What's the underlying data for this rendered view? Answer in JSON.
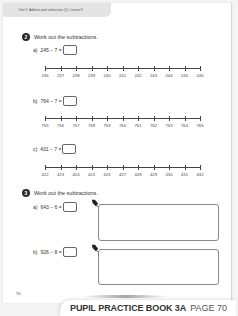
{
  "header": {
    "unit_text": "Unit 2: Addition and subtraction (2), Lesson 8"
  },
  "question2": {
    "number": "2",
    "title": "Work out the subtractions.",
    "parts": [
      {
        "label": "a)",
        "expression": "245 − 7 =",
        "number_line": [
          "236",
          "237",
          "238",
          "239",
          "240",
          "241",
          "242",
          "243",
          "244",
          "245",
          "246"
        ]
      },
      {
        "label": "b)",
        "expression": "764 − 7 =",
        "number_line": [
          "755",
          "756",
          "757",
          "758",
          "759",
          "760",
          "761",
          "762",
          "763",
          "764",
          "765"
        ]
      },
      {
        "label": "c)",
        "expression": "431 − 7 =",
        "number_line": [
          "422",
          "423",
          "424",
          "425",
          "426",
          "427",
          "428",
          "429",
          "430",
          "431",
          "432"
        ]
      }
    ]
  },
  "question3": {
    "number": "3",
    "title": "Work out the subtractions.",
    "parts": [
      {
        "label": "a)",
        "expression": "643 − 6 ="
      },
      {
        "label": "b)",
        "expression": "926 − 8 ="
      }
    ]
  },
  "page_number": "70",
  "footer": {
    "book": "PUPIL PRACTICE BOOK 3A",
    "page": "PAGE 70"
  }
}
